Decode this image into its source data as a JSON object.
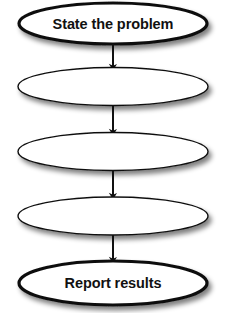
{
  "diagram": {
    "type": "flowchart",
    "orientation": "vertical",
    "background_color": "#ffffff",
    "stroke_color": "#111111",
    "fill_color": "#ffffff",
    "shadow_color": "#b8b8b8",
    "nodes": [
      {
        "id": "node-1",
        "shape": "ellipse",
        "label": "State the problem",
        "filled_label": true,
        "emphasis": "bold",
        "stroke_width": 3.2,
        "cx": 113,
        "cy": 23.5,
        "rx": 94,
        "ry": 20.5
      },
      {
        "id": "node-2",
        "shape": "ellipse",
        "label": "",
        "filled_label": false,
        "emphasis": "normal",
        "stroke_width": 1.4,
        "cx": 113,
        "cy": 86.5,
        "rx": 95,
        "ry": 19
      },
      {
        "id": "node-3",
        "shape": "ellipse",
        "label": "",
        "filled_label": false,
        "emphasis": "normal",
        "stroke_width": 1.4,
        "cx": 113,
        "cy": 151.5,
        "rx": 95,
        "ry": 19
      },
      {
        "id": "node-4",
        "shape": "ellipse",
        "label": "",
        "filled_label": false,
        "emphasis": "normal",
        "stroke_width": 1.4,
        "cx": 113,
        "cy": 216,
        "rx": 95,
        "ry": 19
      },
      {
        "id": "node-5",
        "shape": "ellipse",
        "label": "Report results",
        "filled_label": true,
        "emphasis": "bold",
        "stroke_width": 3.2,
        "cx": 113,
        "cy": 283,
        "rx": 94,
        "ry": 22
      }
    ],
    "connectors": [
      {
        "id": "arrow-1",
        "from": "node-1",
        "to": "node-2",
        "x": 113,
        "y_start": 44,
        "y_end": 67,
        "direction": "down"
      },
      {
        "id": "arrow-2",
        "from": "node-2",
        "to": "node-3",
        "x": 113,
        "y_start": 106,
        "y_end": 132,
        "direction": "down"
      },
      {
        "id": "arrow-3",
        "from": "node-3",
        "to": "node-4",
        "x": 113,
        "y_start": 171,
        "y_end": 196,
        "direction": "down"
      },
      {
        "id": "arrow-4",
        "from": "node-4",
        "to": "node-5",
        "x": 113,
        "y_start": 235,
        "y_end": 260,
        "direction": "down"
      }
    ]
  }
}
